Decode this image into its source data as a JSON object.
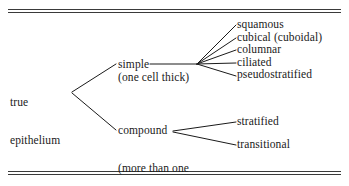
{
  "diagram": {
    "type": "classification-tree",
    "orientation": "left-to-right",
    "background_color": "#ffffff",
    "line_color": "#1a1a1a",
    "text_color": "#1a1a1a",
    "rules": {
      "top_rule_label": "double-rule",
      "bottom_rule_label": "double-rule"
    },
    "root": {
      "line1": "true",
      "line2": "epithelium"
    },
    "branches": [
      {
        "id": "simple",
        "label": "simple",
        "sublabel": "(one cell thick)",
        "leaves": [
          {
            "id": "squamous",
            "label": "squamous"
          },
          {
            "id": "cubical",
            "label": "cubical (cuboidal)"
          },
          {
            "id": "columnar",
            "label": "columnar"
          },
          {
            "id": "ciliated",
            "label": "ciliated"
          },
          {
            "id": "pseudostratified",
            "label": "pseudostratified"
          }
        ]
      },
      {
        "id": "compound",
        "label": "compound",
        "sublabel_line1": "(more than one",
        "sublabel_line2": "cell thick)",
        "leaves": [
          {
            "id": "stratified",
            "label": "stratified"
          },
          {
            "id": "transitional",
            "label": "transitional"
          }
        ]
      }
    ]
  }
}
